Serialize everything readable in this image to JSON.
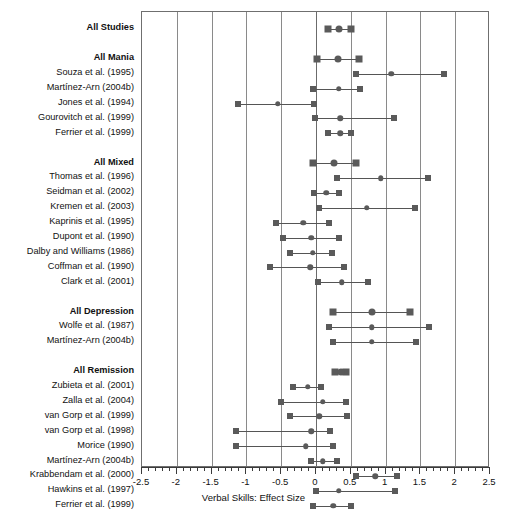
{
  "chart_data": {
    "type": "scatter",
    "title": "",
    "xlabel": "Verbal Skills: Effect Size",
    "ylabel": "",
    "xlim": [
      -2.5,
      2.5
    ],
    "grid": true,
    "legend": "none",
    "xticks": [
      "-2.5",
      "-2",
      "-1.5",
      "-1",
      "-0.5",
      "0",
      "0.5",
      "1",
      "1.5",
      "2",
      "2.5"
    ],
    "xtick_values": [
      -2.5,
      -2,
      -1.5,
      -1,
      -0.5,
      0,
      0.5,
      1,
      1.5,
      2,
      2.5
    ],
    "minor_tick_step": 0.1,
    "rows": [
      {
        "label": "All Studies",
        "group": true,
        "estimate": 0.33,
        "low": 0.17,
        "high": 0.5
      },
      {
        "label": "",
        "spacer": true
      },
      {
        "label": "All Mania",
        "group": true,
        "estimate": 0.32,
        "low": 0.02,
        "high": 0.62
      },
      {
        "label": "Souza et al. (1995)",
        "group": false,
        "estimate": 1.08,
        "low": 0.58,
        "high": 1.84
      },
      {
        "label": "Martínez-Arn (2004b)",
        "group": false,
        "estimate": 0.33,
        "low": -0.05,
        "high": 0.63
      },
      {
        "label": "Jones et al. (1994)",
        "group": false,
        "estimate": -0.55,
        "low": -1.12,
        "high": -0.03
      },
      {
        "label": "Gourovitch et al. (1999)",
        "group": false,
        "estimate": 0.35,
        "low": -0.02,
        "high": 1.12
      },
      {
        "label": "Ferrier et al. (1999)",
        "group": false,
        "estimate": 0.35,
        "low": 0.17,
        "high": 0.5
      },
      {
        "label": "",
        "spacer": true
      },
      {
        "label": "All Mixed",
        "group": true,
        "estimate": 0.26,
        "low": -0.04,
        "high": 0.57
      },
      {
        "label": "Thomas et al. (1996)",
        "group": false,
        "estimate": 0.93,
        "low": 0.3,
        "high": 1.61
      },
      {
        "label": "Seidman et al. (2002)",
        "group": false,
        "estimate": 0.15,
        "low": -0.03,
        "high": 0.33
      },
      {
        "label": "Kremen et al. (2003)",
        "group": false,
        "estimate": 0.73,
        "low": 0.05,
        "high": 1.42
      },
      {
        "label": "Kaprinis et al. (1995)",
        "group": false,
        "estimate": -0.18,
        "low": -0.57,
        "high": 0.18
      },
      {
        "label": "Dupont et al. (1990)",
        "group": false,
        "estimate": -0.07,
        "low": -0.47,
        "high": 0.33
      },
      {
        "label": "Dalby and Williams (1986)",
        "group": false,
        "estimate": -0.05,
        "low": -0.38,
        "high": 0.23
      },
      {
        "label": "Coffman et al. (1990)",
        "group": false,
        "estimate": -0.08,
        "low": -0.66,
        "high": 0.4
      },
      {
        "label": "Clark et al. (2001)",
        "group": false,
        "estimate": 0.37,
        "low": 0.03,
        "high": 0.75
      },
      {
        "label": "",
        "spacer": true
      },
      {
        "label": "All Depression",
        "group": true,
        "estimate": 0.8,
        "low": 0.25,
        "high": 1.35
      },
      {
        "label": "Wolfe et al. (1987)",
        "group": false,
        "estimate": 0.8,
        "low": 0.18,
        "high": 1.62
      },
      {
        "label": "Martínez-Arn (2004b)",
        "group": false,
        "estimate": 0.8,
        "low": 0.25,
        "high": 1.43
      },
      {
        "label": "",
        "spacer": true
      },
      {
        "label": "All Remission",
        "group": true,
        "estimate": 0.36,
        "low": 0.28,
        "high": 0.43
      },
      {
        "label": "Zubieta et al. (2001)",
        "group": false,
        "estimate": -0.12,
        "low": -0.33,
        "high": 0.07
      },
      {
        "label": "Zalla et al. (2004)",
        "group": false,
        "estimate": 0.1,
        "low": -0.5,
        "high": 0.43
      },
      {
        "label": "van Gorp et al. (1999)",
        "group": false,
        "estimate": 0.05,
        "low": -0.37,
        "high": 0.45
      },
      {
        "label": "van Gorp et al. (1998)",
        "group": false,
        "estimate": -0.07,
        "low": -1.15,
        "high": 0.2
      },
      {
        "label": "Morice (1990)",
        "group": false,
        "estimate": -0.15,
        "low": -1.15,
        "high": 0.25
      },
      {
        "label": "Martínez-Arn (2004b)",
        "group": false,
        "estimate": 0.1,
        "low": -0.07,
        "high": 0.3
      },
      {
        "label": "Krabbendam et al. (2000)",
        "group": false,
        "estimate": 0.85,
        "low": 0.57,
        "high": 1.17
      },
      {
        "label": "Hawkins et al. (1997)",
        "group": false,
        "estimate": 0.33,
        "low": 0.0,
        "high": 1.13
      },
      {
        "label": "Ferrier et al. (1999)",
        "group": false,
        "estimate": 0.25,
        "low": -0.05,
        "high": 0.5
      },
      {
        "label": "Docherty et al. (1996)",
        "group": false,
        "estimate": 0.22,
        "low": -0.05,
        "high": 0.47
      },
      {
        "label": "Cavanagh et al. (2002)",
        "group": false,
        "estimate": 1.03,
        "low": 0.52,
        "high": 1.65
      },
      {
        "label": "Ali et al. (2000)",
        "group": false,
        "estimate": 0.25,
        "low": -0.1,
        "high": 0.77
      }
    ]
  },
  "style": {
    "marker_color": "#5a5a5a",
    "line_color": "#555555",
    "grid_color": "#8a8a8a",
    "axis_color": "#3b3b3b",
    "text_color": "#111111"
  }
}
